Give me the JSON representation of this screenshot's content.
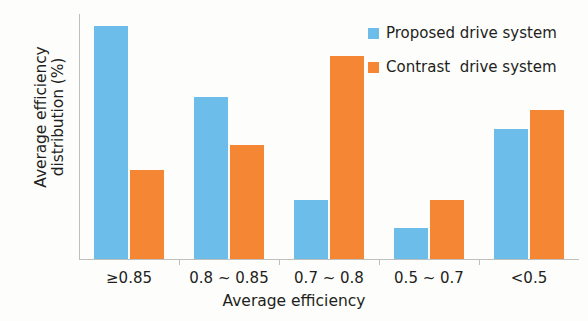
{
  "chart_data": {
    "type": "bar",
    "title": "",
    "xlabel": "Average efficiency",
    "ylabel": "Average efficiency distribution (%)",
    "ylabel_lines": [
      "Average efficiency",
      "distribution (%)"
    ],
    "categories": [
      "≥0.85",
      "0.8 ~ 0.85",
      "0.7 ~ 0.8",
      "0.5 ~ 0.7",
      "<0.5"
    ],
    "series": [
      {
        "name": "Proposed drive system",
        "color": "#6cbde9",
        "values": [
          38.0,
          26.5,
          9.6,
          5.1,
          21.3
        ]
      },
      {
        "name": "Contrast  drive system",
        "color": "#f58634",
        "values": [
          14.6,
          18.6,
          33.1,
          9.7,
          24.4
        ]
      }
    ],
    "ylim": [
      0,
      40
    ],
    "yticks": [
      0,
      5,
      10,
      15,
      20,
      25,
      30,
      35,
      40
    ],
    "ytick_labels": [
      "0",
      "5",
      "10",
      "15",
      "20",
      "25",
      "30",
      "35",
      "40"
    ],
    "grid": false,
    "legend_position": "top-right"
  }
}
